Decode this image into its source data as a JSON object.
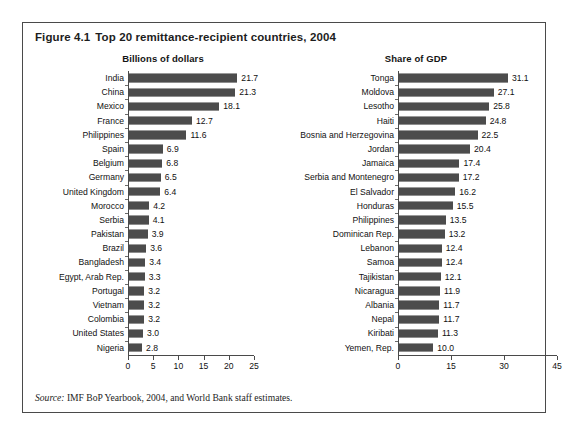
{
  "figure": {
    "number": "Figure 4.1",
    "title": "Top 20 remittance-recipient countries, 2004",
    "source_prefix": "Source:",
    "source_text": " IMF BoP Yearbook, 2004, and World Bank staff estimates."
  },
  "colors": {
    "bar_fill": "#4c4c4c",
    "frame": "#4a4a4a",
    "text": "#111111",
    "background": "#ffffff"
  },
  "chart_data": [
    {
      "type": "bar",
      "orientation": "horizontal",
      "title": "Billions of dollars",
      "xlabel": "",
      "ylabel": "",
      "xlim": [
        0,
        25
      ],
      "xticks": [
        0,
        5,
        10,
        15,
        20,
        25
      ],
      "grid": false,
      "legend": "none",
      "value_labels": true,
      "categories": [
        "India",
        "China",
        "Mexico",
        "France",
        "Philippines",
        "Spain",
        "Belgium",
        "Germany",
        "United Kingdom",
        "Morocco",
        "Serbia",
        "Pakistan",
        "Brazil",
        "Bangladesh",
        "Egypt, Arab Rep.",
        "Portugal",
        "Vietnam",
        "Colombia",
        "United States",
        "Nigeria"
      ],
      "values": [
        21.7,
        21.3,
        18.1,
        12.7,
        11.6,
        6.9,
        6.8,
        6.5,
        6.4,
        4.2,
        4.1,
        3.9,
        3.6,
        3.4,
        3.3,
        3.2,
        3.2,
        3.2,
        3.0,
        2.8
      ],
      "labels": [
        "21.7",
        "21.3",
        "18.1",
        "12.7",
        "11.6",
        "6.9",
        "6.8",
        "6.5",
        "6.4",
        "4.2",
        "4.1",
        "3.9",
        "3.6",
        "3.4",
        "3.3",
        "3.2",
        "3.2",
        "3.2",
        "3.0",
        "2.8"
      ]
    },
    {
      "type": "bar",
      "orientation": "horizontal",
      "title": "Share of GDP",
      "xlabel": "",
      "ylabel": "",
      "xlim": [
        0,
        45
      ],
      "xticks": [
        0,
        15,
        30,
        45
      ],
      "grid": false,
      "legend": "none",
      "value_labels": true,
      "categories": [
        "Tonga",
        "Moldova",
        "Lesotho",
        "Haiti",
        "Bosnia and Herzegovina",
        "Jordan",
        "Jamaica",
        "Serbia and Montenegro",
        "El Salvador",
        "Honduras",
        "Philippines",
        "Dominican Rep.",
        "Lebanon",
        "Samoa",
        "Tajikistan",
        "Nicaragua",
        "Albania",
        "Nepal",
        "Kiribati",
        "Yemen, Rep."
      ],
      "values": [
        31.1,
        27.1,
        25.8,
        24.8,
        22.5,
        20.4,
        17.4,
        17.2,
        16.2,
        15.5,
        13.5,
        13.2,
        12.4,
        12.4,
        12.1,
        11.9,
        11.7,
        11.7,
        11.3,
        10.0
      ],
      "labels": [
        "31.1",
        "27.1",
        "25.8",
        "24.8",
        "22.5",
        "20.4",
        "17.4",
        "17.2",
        "16.2",
        "15.5",
        "13.5",
        "13.2",
        "12.4",
        "12.4",
        "12.1",
        "11.9",
        "11.7",
        "11.7",
        "11.3",
        "10.0"
      ]
    }
  ]
}
